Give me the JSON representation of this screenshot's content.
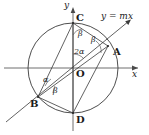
{
  "figure": {
    "width": 149,
    "height": 135,
    "background": "#ffffff",
    "stroke_color": "#3a3a3a",
    "text_color": "#1a1a1a"
  },
  "axes": {
    "x_label": "x",
    "y_label": "y",
    "origin_label": "O",
    "x_axis": {
      "y": 68,
      "x_start": 4,
      "x_end": 140
    },
    "y_axis": {
      "x": 73,
      "y_start": 8,
      "y_end": 131
    }
  },
  "line": {
    "equation_label": "y = mx",
    "slope_sign": "positive",
    "from": {
      "x": 6,
      "y": 122
    },
    "to": {
      "x": 131,
      "y": 20
    }
  },
  "circle": {
    "center": {
      "x": 73,
      "y": 68
    },
    "radius": 45
  },
  "points": [
    {
      "name": "A",
      "label": "A",
      "x": 108,
      "y": 46,
      "label_x": 113,
      "label_y": 47
    },
    {
      "name": "B",
      "label": "B",
      "x": 38,
      "y": 97,
      "label_x": 31,
      "label_y": 100
    },
    {
      "name": "C",
      "label": "C",
      "x": 73,
      "y": 23,
      "label_x": 76,
      "label_y": 14
    },
    {
      "name": "D",
      "label": "D",
      "x": 73,
      "y": 113,
      "label_x": 76,
      "label_y": 116
    },
    {
      "name": "O",
      "label": "O",
      "x": 73,
      "y": 68,
      "label_x": 76,
      "label_y": 70
    }
  ],
  "angles": [
    {
      "name": "beta-at-C",
      "label": "β",
      "x": 78,
      "y": 33
    },
    {
      "name": "beta-at-A",
      "label": "β",
      "x": 93,
      "y": 39
    },
    {
      "name": "two-alpha-at-O",
      "label": "2α",
      "x": 74,
      "y": 51
    },
    {
      "name": "alpha-at-B",
      "label": "α",
      "x": 44,
      "y": 79
    },
    {
      "name": "beta-at-B",
      "label": "β",
      "x": 53,
      "y": 90
    }
  ],
  "chords": [
    {
      "name": "chord-CA",
      "from": "C",
      "to": "A"
    },
    {
      "name": "chord-CB",
      "from": "C",
      "to": "B"
    },
    {
      "name": "chord-CD",
      "from": "C",
      "to": "D"
    },
    {
      "name": "chord-AB",
      "from": "A",
      "to": "B"
    },
    {
      "name": "chord-AD",
      "from": "A",
      "to": "D"
    },
    {
      "name": "chord-BD",
      "from": "B",
      "to": "D"
    },
    {
      "name": "radius-OA",
      "from": "O",
      "to": "A"
    },
    {
      "name": "radius-OB",
      "from": "O",
      "to": "B"
    }
  ]
}
